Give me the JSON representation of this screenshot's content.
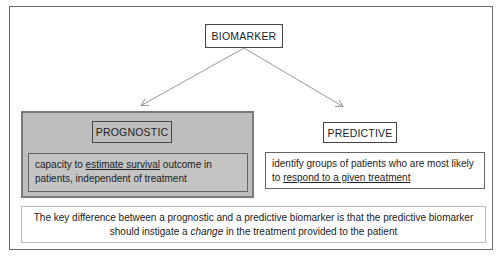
{
  "diagram": {
    "root": {
      "label": "BIOMARKER"
    },
    "branches": [
      {
        "label": "PROGNOSTIC",
        "highlighted": true,
        "description": {
          "pre": "capacity to ",
          "emphasis": "estimate survival",
          "post": " outcome in patients, independent of treatment"
        }
      },
      {
        "label": "PREDICTIVE",
        "highlighted": false,
        "description": {
          "pre": "identify groups of patients who are most likely to ",
          "emphasis": "respond to a given treatment",
          "post": ""
        }
      }
    ],
    "footnote": {
      "pre": "The key difference between a prognostic and a predictive biomarker is that the predictive biomarker should instigate a ",
      "emphasis": "change",
      "post": " in the treatment provided to the patient"
    },
    "colors": {
      "highlight_fill": "#bdbdbd",
      "border": "#444444",
      "arrow": "#999999"
    }
  }
}
